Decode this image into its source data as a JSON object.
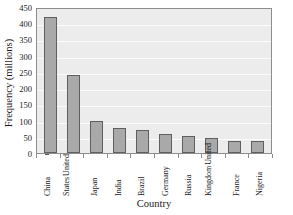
{
  "chart_data": {
    "type": "bar",
    "title": "",
    "xlabel": "Country",
    "ylabel": "Frequency (millions)",
    "categories": [
      "China",
      "United States",
      "Japan",
      "India",
      "Brazil",
      "Germany",
      "Russia",
      "United Kingdom",
      "France",
      "Nigeria"
    ],
    "category_lines": [
      [
        "China"
      ],
      [
        "United",
        "States"
      ],
      [
        "Japan"
      ],
      [
        "India"
      ],
      [
        "Brazil"
      ],
      [
        "Germany"
      ],
      [
        "Russia"
      ],
      [
        "United",
        "Kingdom"
      ],
      [
        "France"
      ],
      [
        "Nigeria"
      ]
    ],
    "values": [
      418,
      239,
      98,
      78,
      72,
      60,
      53,
      45,
      38,
      36
    ],
    "ylim": [
      0,
      450
    ],
    "yticks": [
      0,
      50,
      100,
      150,
      200,
      250,
      300,
      350,
      400,
      450
    ],
    "ytick_labels": [
      "0",
      "50",
      "100",
      "150",
      "200",
      "250",
      "300",
      "350",
      "400",
      "450"
    ],
    "grid": true,
    "legend": false,
    "legend_position": "none",
    "colors": {
      "bar_fill": "#a9a9a9",
      "bar_edge": "#5f5f5f",
      "plot_background": "#ececec",
      "gridline": "#fbfbfb",
      "frame": "#8d8d8d",
      "text": "#1a1a1a",
      "figure_background": "#ffffff"
    }
  }
}
